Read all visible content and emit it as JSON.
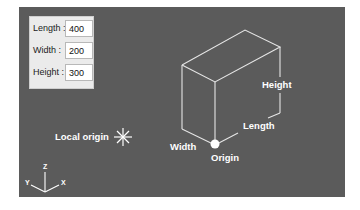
{
  "parameters": {
    "fields": [
      {
        "label": "Length :",
        "value": "400"
      },
      {
        "label": "Width :",
        "value": "200"
      },
      {
        "label": "Height :",
        "value": "300"
      }
    ]
  },
  "diagram": {
    "labels": {
      "height": "Height",
      "length": "Length",
      "width": "Width",
      "origin": "Origin",
      "local_origin": "Local origin"
    },
    "axes": {
      "z": "Z",
      "x": "X",
      "y": "Y"
    },
    "colors": {
      "viewport_bg": "#5b5b5b",
      "lines": "#e8e8e8",
      "text": "#ffffff",
      "panel_bg": "#ebebeb"
    }
  }
}
